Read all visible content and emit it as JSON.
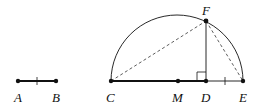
{
  "diagram": {
    "type": "geometric-construction",
    "points": {
      "A": {
        "label": "A",
        "x": 18,
        "y": 81
      },
      "B": {
        "label": "B",
        "x": 56,
        "y": 81
      },
      "C": {
        "label": "C",
        "x": 111,
        "y": 81
      },
      "M": {
        "label": "M",
        "x": 178,
        "y": 81
      },
      "D": {
        "label": "D",
        "x": 206,
        "y": 81
      },
      "E": {
        "label": "E",
        "x": 243,
        "y": 81
      },
      "F": {
        "label": "F",
        "x": 206,
        "y": 21
      }
    },
    "segments": [
      {
        "from": "A",
        "to": "B",
        "style": "bold",
        "tick": true
      },
      {
        "from": "C",
        "to": "D",
        "style": "bold"
      },
      {
        "from": "D",
        "to": "E",
        "style": "thin",
        "tick": true
      },
      {
        "from": "D",
        "to": "F",
        "style": "thin"
      },
      {
        "from": "C",
        "to": "F",
        "style": "dashed"
      },
      {
        "from": "F",
        "to": "E",
        "style": "dashed"
      }
    ],
    "arc": {
      "type": "semicircle",
      "diameter": [
        "C",
        "E"
      ],
      "center": "M"
    },
    "right_angle": {
      "at": "D"
    },
    "colors": {
      "stroke": "#111111",
      "background": "#ffffff"
    }
  }
}
